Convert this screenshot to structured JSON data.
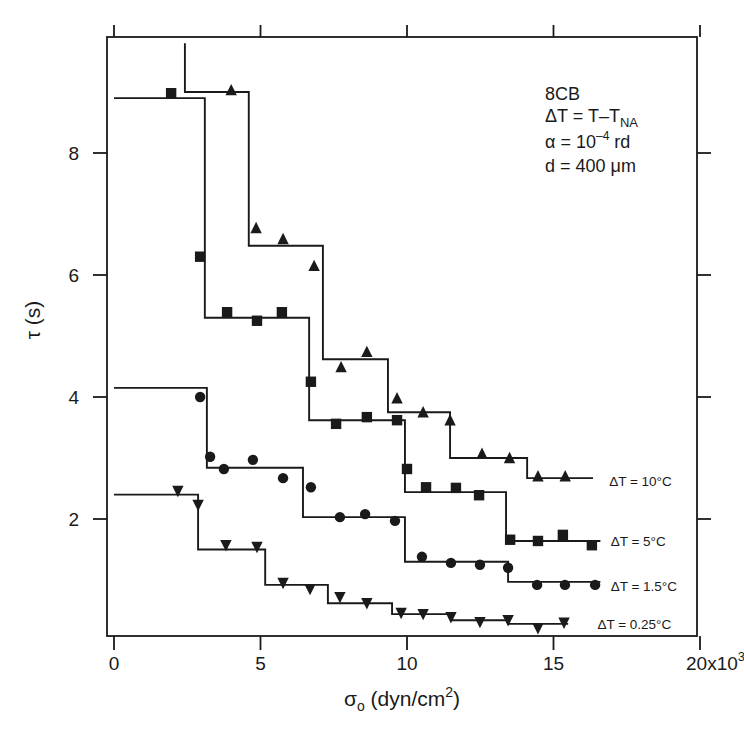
{
  "chart_data": {
    "type": "line",
    "subtype": "step-with-markers",
    "title": "",
    "xlabel": "σo (dyn/cm²)",
    "xlabel_parts": {
      "symbol": "σ",
      "sub": "o",
      "unit_pre": " (dyn/cm",
      "sup": "2",
      "unit_post": ")"
    },
    "ylabel": "τ (s)",
    "xlim": [
      -0.25,
      19.9
    ],
    "ylim": [
      0.08,
      9.9
    ],
    "x_scale_note": "x10^3",
    "xticks": [
      0,
      5,
      10,
      15,
      20
    ],
    "xtick_labels": [
      "0",
      "5",
      "10",
      "15",
      "20x10"
    ],
    "xtick_last_sup": "3",
    "yticks": [
      2,
      4,
      6,
      8
    ],
    "ytick_labels": [
      "2",
      "4",
      "6",
      "8"
    ],
    "grid": false,
    "legend_position": "inline-right",
    "annotations": {
      "lines": [
        {
          "text": "8CB"
        },
        {
          "text": "ΔT = T–T",
          "sub": "NA"
        },
        {
          "text": "α = 10",
          "sup": "–4",
          "post": " rd"
        },
        {
          "text": "d = 400 μm"
        }
      ]
    },
    "series": [
      {
        "name": "ΔT = 10°C",
        "marker": "triangle-up",
        "points": [
          [
            4.0,
            9.03
          ],
          [
            4.85,
            6.77
          ],
          [
            5.77,
            6.59
          ],
          [
            6.83,
            6.15
          ],
          [
            7.75,
            4.49
          ],
          [
            8.63,
            4.74
          ],
          [
            9.66,
            3.98
          ],
          [
            10.55,
            3.75
          ],
          [
            11.47,
            3.62
          ],
          [
            12.56,
            3.07
          ],
          [
            13.5,
            3.0
          ],
          [
            14.47,
            2.7
          ],
          [
            15.4,
            2.7
          ]
        ],
        "step_fit": {
          "start_top": 9.8,
          "x_start": 2.42,
          "levels": [
            9.0,
            6.48,
            4.62,
            3.75,
            3.0,
            2.67
          ],
          "breaks": [
            4.6,
            7.13,
            9.35,
            11.47,
            14.1
          ],
          "x_end": 16.35
        },
        "label_pos": [
          16.9,
          2.62
        ]
      },
      {
        "name": "ΔT = 5°C",
        "marker": "square",
        "points": [
          [
            1.95,
            8.98
          ],
          [
            2.94,
            6.3
          ],
          [
            3.86,
            5.39
          ],
          [
            4.88,
            5.25
          ],
          [
            5.73,
            5.39
          ],
          [
            6.72,
            4.25
          ],
          [
            7.58,
            3.56
          ],
          [
            8.63,
            3.67
          ],
          [
            9.66,
            3.62
          ],
          [
            10.0,
            2.82
          ],
          [
            10.65,
            2.52
          ],
          [
            11.67,
            2.51
          ],
          [
            12.46,
            2.39
          ],
          [
            13.52,
            1.66
          ],
          [
            14.47,
            1.64
          ],
          [
            15.32,
            1.74
          ],
          [
            16.31,
            1.57
          ]
        ],
        "step_fit": {
          "x_start": 0.0,
          "levels": [
            8.9,
            5.3,
            3.62,
            2.44,
            1.64
          ],
          "breaks": [
            3.1,
            6.66,
            9.93,
            13.38
          ],
          "x_end": 16.6
        },
        "label_pos": [
          16.95,
          1.64
        ]
      },
      {
        "name": "ΔT = 1.5°C",
        "marker": "circle",
        "points": [
          [
            2.94,
            4.0
          ],
          [
            3.28,
            3.02
          ],
          [
            3.75,
            2.82
          ],
          [
            4.74,
            2.97
          ],
          [
            5.77,
            2.67
          ],
          [
            6.72,
            2.52
          ],
          [
            7.71,
            2.03
          ],
          [
            8.57,
            2.08
          ],
          [
            9.59,
            1.97
          ],
          [
            10.51,
            1.38
          ],
          [
            11.5,
            1.28
          ],
          [
            12.49,
            1.25
          ],
          [
            13.45,
            1.2
          ],
          [
            14.44,
            0.92
          ],
          [
            15.39,
            0.92
          ],
          [
            16.42,
            0.92
          ]
        ],
        "step_fit": {
          "x_start": 0.0,
          "levels": [
            4.15,
            2.84,
            2.03,
            1.3,
            0.97
          ],
          "breaks": [
            3.17,
            6.45,
            9.93,
            13.45
          ],
          "x_end": 16.6
        },
        "label_pos": [
          16.95,
          0.9
        ]
      },
      {
        "name": "ΔT = 0.25°C",
        "marker": "triangle-down",
        "points": [
          [
            2.18,
            2.46
          ],
          [
            2.87,
            2.23
          ],
          [
            3.82,
            1.57
          ],
          [
            4.88,
            1.54
          ],
          [
            5.77,
            0.95
          ],
          [
            6.69,
            0.85
          ],
          [
            7.71,
            0.72
          ],
          [
            8.63,
            0.62
          ],
          [
            9.8,
            0.46
          ],
          [
            10.55,
            0.44
          ],
          [
            11.5,
            0.39
          ],
          [
            12.49,
            0.31
          ],
          [
            13.45,
            0.34
          ],
          [
            14.47,
            0.21
          ],
          [
            15.36,
            0.3
          ]
        ],
        "step_fit": {
          "x_start": 0.0,
          "levels": [
            2.4,
            1.5,
            0.92,
            0.62,
            0.44,
            0.34,
            0.28
          ],
          "breaks": [
            2.87,
            5.16,
            7.3,
            9.49,
            11.54,
            13.45
          ],
          "x_end": 15.5
        },
        "label_pos": [
          16.5,
          0.28
        ]
      }
    ],
    "colors": {
      "ink": "#1a1a1a",
      "background": "#ffffff"
    }
  }
}
